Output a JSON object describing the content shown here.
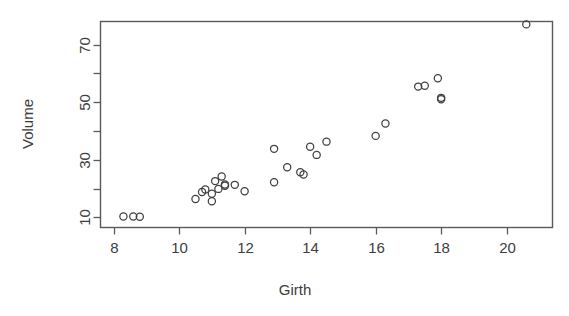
{
  "chart_data": {
    "type": "scatter",
    "title": "",
    "xlabel": "Girth",
    "ylabel": "Volume",
    "xlim": [
      7.6,
      21.4
    ],
    "ylim": [
      6.5,
      78.0
    ],
    "grid": false,
    "legend": null,
    "x_ticks": [
      8,
      10,
      12,
      14,
      16,
      18,
      20
    ],
    "x_tick_labels": [
      "8",
      "10",
      "12",
      "14",
      "16",
      "18",
      "20"
    ],
    "y_ticks": [
      10,
      20,
      30,
      40,
      50,
      60,
      70
    ],
    "y_tick_labels": [
      "10",
      "",
      "30",
      "",
      "50",
      "",
      "70"
    ],
    "y_labeled_ticks": [
      10,
      30,
      50,
      70
    ],
    "marker": "open-circle",
    "marker_color": "#404040",
    "n_points": 31,
    "x": [
      8.3,
      8.6,
      8.8,
      10.5,
      10.7,
      10.8,
      11.0,
      11.0,
      11.1,
      11.2,
      11.3,
      11.4,
      11.4,
      11.7,
      12.0,
      12.9,
      12.9,
      13.3,
      13.7,
      13.8,
      14.0,
      14.2,
      14.5,
      16.0,
      16.3,
      17.3,
      17.5,
      17.9,
      18.0,
      18.0,
      20.6
    ],
    "y": [
      10.3,
      10.3,
      10.2,
      16.4,
      18.8,
      19.7,
      15.6,
      18.2,
      22.6,
      19.9,
      24.2,
      21.0,
      21.4,
      21.3,
      19.1,
      22.2,
      33.8,
      27.4,
      25.7,
      24.9,
      34.5,
      31.7,
      36.3,
      38.3,
      42.6,
      55.4,
      55.7,
      58.3,
      51.5,
      51.0,
      77.0
    ],
    "points": [
      {
        "x": 8.3,
        "y": 10.3
      },
      {
        "x": 8.6,
        "y": 10.3
      },
      {
        "x": 8.8,
        "y": 10.2
      },
      {
        "x": 10.5,
        "y": 16.4
      },
      {
        "x": 10.7,
        "y": 18.8
      },
      {
        "x": 10.8,
        "y": 19.7
      },
      {
        "x": 11.0,
        "y": 15.6
      },
      {
        "x": 11.0,
        "y": 18.2
      },
      {
        "x": 11.1,
        "y": 22.6
      },
      {
        "x": 11.2,
        "y": 19.9
      },
      {
        "x": 11.3,
        "y": 24.2
      },
      {
        "x": 11.4,
        "y": 21.0
      },
      {
        "x": 11.4,
        "y": 21.4
      },
      {
        "x": 11.7,
        "y": 21.3
      },
      {
        "x": 12.0,
        "y": 19.1
      },
      {
        "x": 12.9,
        "y": 22.2
      },
      {
        "x": 12.9,
        "y": 33.8
      },
      {
        "x": 13.3,
        "y": 27.4
      },
      {
        "x": 13.7,
        "y": 25.7
      },
      {
        "x": 13.8,
        "y": 24.9
      },
      {
        "x": 14.0,
        "y": 34.5
      },
      {
        "x": 14.2,
        "y": 31.7
      },
      {
        "x": 14.5,
        "y": 36.3
      },
      {
        "x": 16.0,
        "y": 38.3
      },
      {
        "x": 16.3,
        "y": 42.6
      },
      {
        "x": 17.3,
        "y": 55.4
      },
      {
        "x": 17.5,
        "y": 55.7
      },
      {
        "x": 17.9,
        "y": 58.3
      },
      {
        "x": 18.0,
        "y": 51.5
      },
      {
        "x": 18.0,
        "y": 51.0
      },
      {
        "x": 20.6,
        "y": 77.0
      }
    ]
  },
  "colors": {
    "marker_stroke": "#404040",
    "axis": "#5a5a5a",
    "text": "#3d3d3d",
    "background": "#ffffff"
  }
}
